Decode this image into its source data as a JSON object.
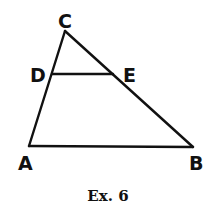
{
  "diagram": {
    "caption": "Ex. 6",
    "vertices": {
      "A": {
        "label": "A",
        "x": 29,
        "y": 146
      },
      "B": {
        "label": "B",
        "x": 193,
        "y": 147
      },
      "C": {
        "label": "C",
        "x": 65,
        "y": 31
      },
      "D": {
        "label": "D",
        "x": 52,
        "y": 74
      },
      "E": {
        "label": "E",
        "x": 113,
        "y": 74
      }
    },
    "segments": [
      {
        "from": "A",
        "to": "C"
      },
      {
        "from": "C",
        "to": "B"
      },
      {
        "from": "A",
        "to": "B"
      },
      {
        "from": "D",
        "to": "E"
      }
    ],
    "colors": {
      "stroke": "#111111",
      "background": "#ffffff"
    }
  }
}
